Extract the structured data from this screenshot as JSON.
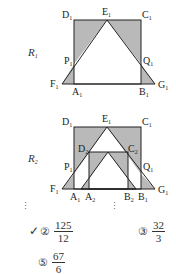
{
  "figure_r1": {
    "row_label": "R",
    "row_sub": "1",
    "points": {
      "D1": "D",
      "C1": "C",
      "E1": "E",
      "P1": "P",
      "Q1": "Q",
      "F1": "F",
      "G1": "G",
      "A1": "A",
      "B1": "B"
    },
    "subscripts": {
      "one": "1"
    },
    "shade_color": "#b9b9b9",
    "line_color": "#222222"
  },
  "figure_r2": {
    "row_label": "R",
    "row_sub": "2",
    "subscripts": {
      "one": "1",
      "two": "2"
    }
  },
  "continuation": {
    "dots": "⋮"
  },
  "choices": [
    {
      "number": "②",
      "numerator": "125",
      "denominator": "12",
      "checked": true,
      "check_mark": "✓"
    },
    {
      "number": "③",
      "numerator": "32",
      "denominator": "3",
      "checked": false
    },
    {
      "number": "⑤",
      "numerator": "67",
      "denominator": "6",
      "checked": false
    }
  ]
}
